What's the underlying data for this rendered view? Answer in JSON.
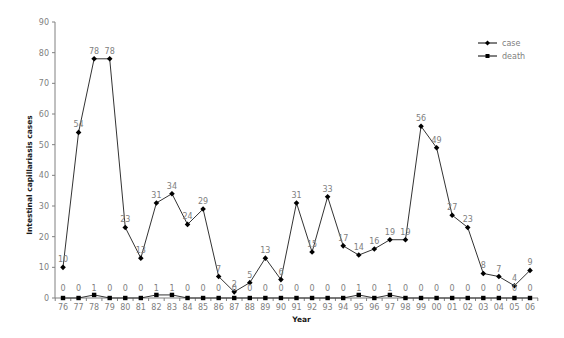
{
  "chart_data": {
    "type": "line",
    "title": "",
    "xlabel": "Year",
    "ylabel": "Intestinal capillariasis cases",
    "ylim": [
      0,
      90
    ],
    "yticks": [
      0,
      10,
      20,
      30,
      40,
      50,
      60,
      70,
      80,
      90
    ],
    "ytick_labels": [
      "0",
      "10",
      "20",
      "30",
      "40",
      "50",
      "60",
      "70",
      "80",
      "90"
    ],
    "categories": [
      "76",
      "77",
      "78",
      "79",
      "80",
      "81",
      "82",
      "83",
      "84",
      "85",
      "86",
      "87",
      "88",
      "89",
      "90",
      "91",
      "92",
      "93",
      "94",
      "95",
      "96",
      "97",
      "98",
      "99",
      "00",
      "01",
      "02",
      "03",
      "04",
      "05",
      "06"
    ],
    "grid": false,
    "legend_position": "top-right",
    "series": [
      {
        "name": "case",
        "marker": "diamond",
        "color": "#000000",
        "values": [
          10,
          54,
          78,
          78,
          23,
          13,
          31,
          34,
          24,
          29,
          7,
          2,
          5,
          13,
          6,
          31,
          15,
          33,
          17,
          14,
          16,
          19,
          19,
          56,
          49,
          27,
          23,
          8,
          7,
          4,
          9
        ]
      },
      {
        "name": "death",
        "marker": "square",
        "color": "#000000",
        "values": [
          0,
          0,
          1,
          0,
          0,
          0,
          1,
          1,
          0,
          0,
          0,
          0,
          0,
          0,
          0,
          0,
          0,
          0,
          0,
          1,
          0,
          1,
          0,
          0,
          0,
          0,
          0,
          0,
          0,
          0,
          0
        ]
      }
    ]
  }
}
